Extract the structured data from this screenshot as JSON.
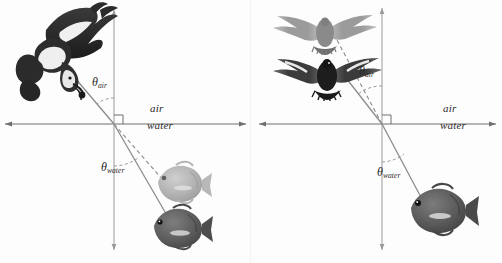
{
  "figure": {
    "medium_upper": "air",
    "medium_lower": "water",
    "theta_symbol": "θ",
    "angle_air_sub": "air",
    "angle_water_sub": "water",
    "colors": {
      "ray": "#8c8c8c",
      "axis": "#6f6f6f",
      "label": "#2a2a2a",
      "bird_dark": "#262626",
      "bird_light": "#8f8f8f",
      "fish_dark": "#585858",
      "fish_light": "#a8a8a8",
      "background": "#fdfdfd"
    }
  },
  "panels": [
    {
      "id": "left",
      "name": "bird-views-fish",
      "origin": {
        "x": 114,
        "y": 124
      },
      "axis": {
        "horizontal": {
          "x1": 5,
          "x2": 246,
          "y": 124
        },
        "vertical": {
          "x": 114,
          "y1": 10,
          "y2": 250
        }
      },
      "labels": {
        "air": {
          "text": "air",
          "x": 150,
          "y": 109
        },
        "water": {
          "text": "water",
          "x": 147,
          "y": 126
        },
        "theta_air": {
          "text": "θ",
          "sub": "air",
          "x": 92,
          "y": 82
        },
        "theta_water": {
          "text": "θ",
          "sub": "water",
          "x": 101,
          "y": 167
        }
      },
      "right_angle_marker": {
        "x": 114,
        "y": 124,
        "size": 9
      },
      "rays": [
        {
          "name": "incident-ray-air",
          "style": "solid",
          "x1": 75,
          "y1": 78,
          "x2": 114,
          "y2": 124
        },
        {
          "name": "refracted-ray-water",
          "style": "solid",
          "x1": 114,
          "y1": 124,
          "x2": 172,
          "y2": 224
        },
        {
          "name": "virtual-ray-apparent-fish",
          "style": "dashed",
          "x1": 114,
          "y1": 124,
          "x2": 163,
          "y2": 180
        }
      ],
      "animals": [
        {
          "name": "bird-diving",
          "kind": "bird-plunging",
          "shade": "dark",
          "x": 12,
          "y": 4,
          "w": 92,
          "h": 102
        },
        {
          "name": "fish-apparent-image",
          "kind": "fish",
          "shade": "light",
          "x": 152,
          "y": 161,
          "w": 56,
          "h": 42
        },
        {
          "name": "fish-real",
          "kind": "fish",
          "shade": "dark",
          "x": 148,
          "y": 205,
          "w": 58,
          "h": 44
        }
      ]
    },
    {
      "id": "right",
      "name": "fish-views-bird",
      "origin": {
        "x": 131,
        "y": 124
      },
      "axis": {
        "horizontal": {
          "x1": 8,
          "x2": 245,
          "y": 124
        },
        "vertical": {
          "x": 131,
          "y1": 8,
          "y2": 250
        }
      },
      "labels": {
        "air": {
          "text": "air",
          "x": 192,
          "y": 109
        },
        "water": {
          "text": "water",
          "x": 189,
          "y": 126
        },
        "theta_air": {
          "text": "θ",
          "sub": "air",
          "x": 108,
          "y": 71
        },
        "theta_water": {
          "text": "θ",
          "sub": "water",
          "x": 126,
          "y": 172
        }
      },
      "right_angle_marker": {
        "x": 131,
        "y": 124,
        "size": 9
      },
      "rays": [
        {
          "name": "incident-ray-air",
          "style": "solid",
          "x1": 88,
          "y1": 69,
          "x2": 131,
          "y2": 124
        },
        {
          "name": "refracted-ray-water",
          "style": "solid",
          "x1": 131,
          "y1": 124,
          "x2": 172,
          "y2": 201
        },
        {
          "name": "virtual-ray-apparent-bird",
          "style": "dashed",
          "x1": 131,
          "y1": 124,
          "x2": 86,
          "y2": 40
        }
      ],
      "animals": [
        {
          "name": "bird-apparent-image",
          "kind": "bird-soaring",
          "shade": "light",
          "x": 20,
          "y": 8,
          "w": 104,
          "h": 44
        },
        {
          "name": "bird-real",
          "kind": "bird-soaring",
          "shade": "dark",
          "x": 24,
          "y": 52,
          "w": 106,
          "h": 46
        },
        {
          "name": "fish-real",
          "kind": "fish",
          "shade": "dark",
          "x": 155,
          "y": 186,
          "w": 62,
          "h": 46
        }
      ]
    }
  ]
}
